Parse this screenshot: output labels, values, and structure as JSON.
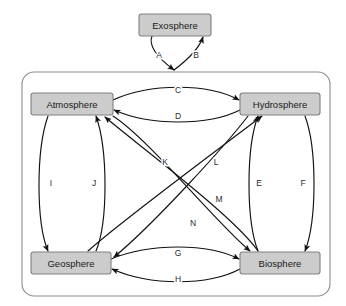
{
  "diagram": {
    "colors": {
      "box_fill": "#cccccc",
      "box_stroke": "#808080",
      "container_stroke": "#8c8c8c",
      "arrow": "#111111",
      "background": "#ffffff",
      "label_text": "#1a1a1a"
    },
    "outer_node": {
      "id": "exosphere",
      "label": "Exosphere",
      "x": 139,
      "y": 14,
      "width": 72,
      "height": 22
    },
    "container": {
      "label": "",
      "x": 22,
      "y": 72,
      "width": 308,
      "height": 224,
      "corner_radius": 12
    },
    "nodes": [
      {
        "id": "atmosphere",
        "label": "Atmosphere",
        "x": 31,
        "y": 93,
        "width": 82,
        "height": 22
      },
      {
        "id": "hydrosphere",
        "label": "Hydrosphere",
        "x": 240,
        "y": 93,
        "width": 80,
        "height": 22
      },
      {
        "id": "geosphere",
        "label": "Geosphere",
        "x": 31,
        "y": 252,
        "width": 80,
        "height": 22
      },
      {
        "id": "biosphere",
        "label": "Biosphere",
        "x": 240,
        "y": 252,
        "width": 80,
        "height": 22
      }
    ],
    "edges": [
      {
        "id": "A",
        "label": "A",
        "from": "exosphere",
        "to": "container",
        "label_x": 159,
        "label_y": 56
      },
      {
        "id": "B",
        "label": "B",
        "from": "container",
        "to": "exosphere",
        "label_x": 196,
        "label_y": 56
      },
      {
        "id": "C",
        "label": "C",
        "from": "atmosphere",
        "to": "hydrosphere",
        "label_x": 178,
        "label_y": 91
      },
      {
        "id": "D",
        "label": "D",
        "from": "hydrosphere",
        "to": "atmosphere",
        "label_x": 178,
        "label_y": 117
      },
      {
        "id": "E",
        "label": "E",
        "from": "biosphere",
        "to": "hydrosphere",
        "label_x": 259,
        "label_y": 184
      },
      {
        "id": "F",
        "label": "F",
        "from": "hydrosphere",
        "to": "biosphere",
        "label_x": 303,
        "label_y": 184
      },
      {
        "id": "G",
        "label": "G",
        "from": "geosphere",
        "to": "biosphere",
        "label_x": 178,
        "label_y": 254
      },
      {
        "id": "H",
        "label": "H",
        "from": "biosphere",
        "to": "geosphere",
        "label_x": 178,
        "label_y": 280
      },
      {
        "id": "I",
        "label": "I",
        "from": "atmosphere",
        "to": "geosphere",
        "label_x": 51,
        "label_y": 184
      },
      {
        "id": "J",
        "label": "J",
        "from": "geosphere",
        "to": "atmosphere",
        "label_x": 94,
        "label_y": 184
      },
      {
        "id": "K",
        "label": "K",
        "from": "atmosphere",
        "to": "biosphere",
        "label_x": 165,
        "label_y": 163
      },
      {
        "id": "L",
        "label": "L",
        "from": "hydrosphere",
        "to": "geosphere",
        "label_x": 216,
        "label_y": 163
      },
      {
        "id": "M",
        "label": "M",
        "from": "biosphere",
        "to": "atmosphere",
        "label_x": 219,
        "label_y": 200
      },
      {
        "id": "N",
        "label": "N",
        "from": "geosphere",
        "to": "hydrosphere",
        "label_x": 193,
        "label_y": 224
      }
    ]
  }
}
